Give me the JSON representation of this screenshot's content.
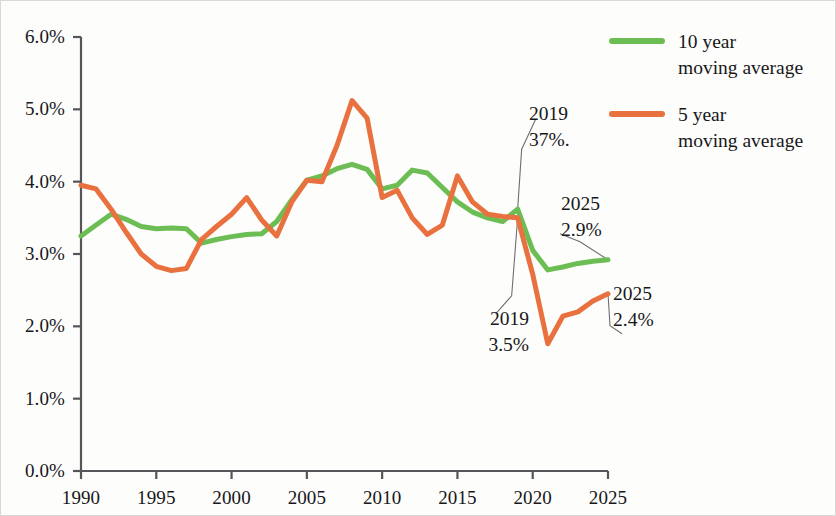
{
  "chart_data": {
    "type": "line",
    "title": "",
    "subtitle": "",
    "xlabel": "",
    "ylabel": "",
    "xlim": [
      1990,
      2025
    ],
    "ylim": [
      0.0,
      6.0
    ],
    "grid": false,
    "legend_position": "top-right",
    "x_ticks": [
      "1990",
      "1995",
      "2000",
      "2005",
      "2010",
      "2015",
      "2020",
      "2025"
    ],
    "x_tick_values": [
      1990,
      1995,
      2000,
      2005,
      2010,
      2015,
      2020,
      2025
    ],
    "y_ticks": [
      "0.0%",
      "1.0%",
      "2.0%",
      "3.0%",
      "4.0%",
      "5.0%",
      "6.0%"
    ],
    "y_tick_values": [
      0.0,
      1.0,
      2.0,
      3.0,
      4.0,
      5.0,
      6.0
    ],
    "x": [
      1990,
      1991,
      1992,
      1993,
      1994,
      1995,
      1996,
      1997,
      1998,
      1999,
      2000,
      2001,
      2002,
      2003,
      2004,
      2005,
      2006,
      2007,
      2008,
      2009,
      2010,
      2011,
      2012,
      2013,
      2014,
      2015,
      2016,
      2017,
      2018,
      2019,
      2020,
      2021,
      2022,
      2023,
      2024,
      2025
    ],
    "series": [
      {
        "name": "10 year moving average",
        "color": "#6cbe54",
        "values": [
          3.25,
          3.4,
          3.55,
          3.48,
          3.38,
          3.35,
          3.36,
          3.35,
          3.15,
          3.2,
          3.24,
          3.27,
          3.28,
          3.45,
          3.75,
          4.02,
          4.08,
          4.18,
          4.24,
          4.17,
          3.9,
          3.95,
          4.16,
          4.12,
          3.92,
          3.72,
          3.58,
          3.5,
          3.45,
          3.62,
          3.05,
          2.78,
          2.82,
          2.87,
          2.9,
          2.92
        ]
      },
      {
        "name": "5 year moving average",
        "color": "#e8713f",
        "values": [
          3.95,
          3.9,
          3.62,
          3.3,
          3.0,
          2.83,
          2.77,
          2.8,
          3.2,
          3.38,
          3.55,
          3.78,
          3.47,
          3.25,
          3.72,
          4.02,
          4.0,
          4.5,
          5.12,
          4.88,
          3.78,
          3.88,
          3.5,
          3.27,
          3.4,
          4.08,
          3.72,
          3.55,
          3.52,
          3.5,
          2.72,
          1.76,
          2.14,
          2.2,
          2.35,
          2.45
        ]
      }
    ],
    "annotations": [
      {
        "id": "green-2019",
        "year_label": "2019",
        "value_label": "37%.",
        "target_x": 2019,
        "target_y": 3.62
      },
      {
        "id": "green-2025",
        "year_label": "2025",
        "value_label": "2.9%",
        "target_x": 2025,
        "target_y": 2.92
      },
      {
        "id": "orange-2019",
        "year_label": "2019",
        "value_label": "3.5%",
        "target_x": 2019,
        "target_y": 3.5
      },
      {
        "id": "orange-2025",
        "year_label": "2025",
        "value_label": "2.4%",
        "target_x": 2025,
        "target_y": 2.45
      }
    ]
  },
  "legend": {
    "entries": [
      {
        "line1": "10 year",
        "line2": "moving average",
        "color": "#6cbe54"
      },
      {
        "line1": "5 year",
        "line2": "moving average",
        "color": "#e8713f"
      }
    ]
  }
}
